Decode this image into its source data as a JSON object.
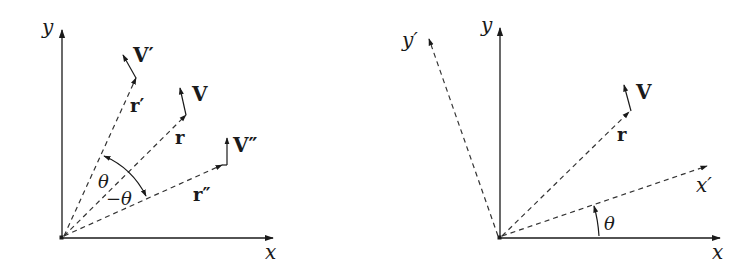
{
  "figure": {
    "left_panel": {
      "axes": {
        "x_label": "x",
        "y_label": "y"
      },
      "position_vectors": [
        {
          "name": "r′",
          "label": "r′",
          "vector_label": "V′"
        },
        {
          "name": "r",
          "label": "r",
          "vector_label": "V"
        },
        {
          "name": "r″",
          "label": "r″",
          "vector_label": "V″"
        }
      ],
      "angles": {
        "theta": "θ",
        "neg_theta": "−θ"
      }
    },
    "right_panel": {
      "axes": {
        "x_label": "x",
        "y_label": "y",
        "x_prime_label": "x′",
        "y_prime_label": "y′"
      },
      "position_vector": {
        "label": "r",
        "vector_label": "V"
      },
      "angle": "θ"
    },
    "colors": {
      "ink": "#1a1a1a",
      "background": "#ffffff"
    }
  }
}
